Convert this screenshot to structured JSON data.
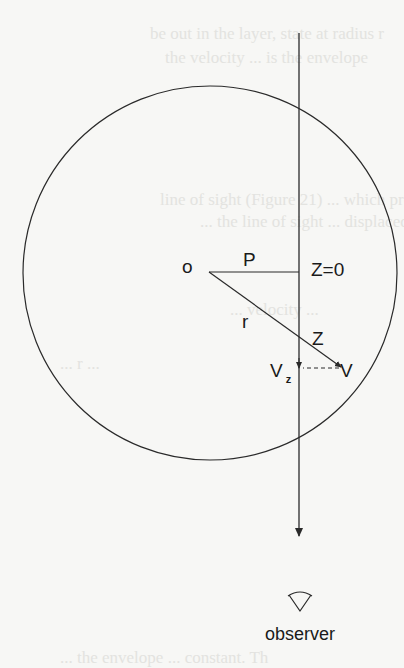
{
  "labels": {
    "origin": "o",
    "impact_parameter": "P",
    "z_zero": "Z=0",
    "radius": "r",
    "z": "Z",
    "v_z_main": "V",
    "v_z_sub": "z",
    "velocity": "V",
    "observer": "observer"
  },
  "background_text": [
    "be out in the layer, state at radius r",
    "the velocity ... is the envelope",
    "line of sight (Figure 21) ... which produces",
    "... the line of sight ... displaced",
    "... velocity ...",
    "... r ...",
    "... the envelope ... constant. Th"
  ],
  "colors": {
    "line": "#2a2a2a",
    "background": "#f7f7f5"
  }
}
